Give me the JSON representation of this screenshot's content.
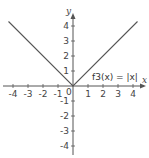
{
  "chart_data": {
    "type": "line",
    "title": "",
    "xlabel": "x",
    "ylabel": "y",
    "xlim": [
      -4.3,
      4.3
    ],
    "ylim": [
      -4.3,
      4.3
    ],
    "grid": false,
    "x_ticks": [
      -4,
      -3,
      -2,
      -1,
      0,
      1,
      2,
      3,
      4
    ],
    "y_ticks": [
      -4,
      -3,
      -2,
      -1,
      1,
      2,
      3,
      4
    ],
    "origin_label": "0",
    "series": [
      {
        "name": "f3(x) = |x|",
        "x": [
          -4.3,
          0,
          4.3
        ],
        "y": [
          4.3,
          0,
          4.3
        ],
        "color": "#555555"
      }
    ],
    "annotations": [
      {
        "text": "f3(x) = |x|",
        "x": 1.2,
        "y": 0.5
      }
    ]
  },
  "labels": {
    "x_axis": "x",
    "y_axis": "y",
    "function": "f3(x) = |x|",
    "origin": "0"
  }
}
